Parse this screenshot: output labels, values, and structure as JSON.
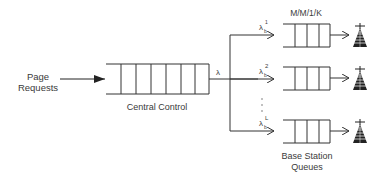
{
  "diagram": {
    "source_label_line1": "Page",
    "source_label_line2": "Requests",
    "central_queue_label": "Central Control",
    "arrival_rate_label": "λ",
    "queue_model_label": "M/M/1/K",
    "base_station_label_line1": "Base Station",
    "base_station_label_line2": "Queues",
    "branches": [
      {
        "rate_symbol": "λ",
        "rate_sub": "b",
        "rate_sup": "1"
      },
      {
        "rate_symbol": "λ",
        "rate_sub": "b",
        "rate_sup": "2"
      },
      {
        "rate_symbol": "λ",
        "rate_sub": "b",
        "rate_sup": "L"
      }
    ],
    "ellipsis": "·  ·  ·",
    "icons": {
      "antenna": "radio-tower-icon"
    }
  }
}
